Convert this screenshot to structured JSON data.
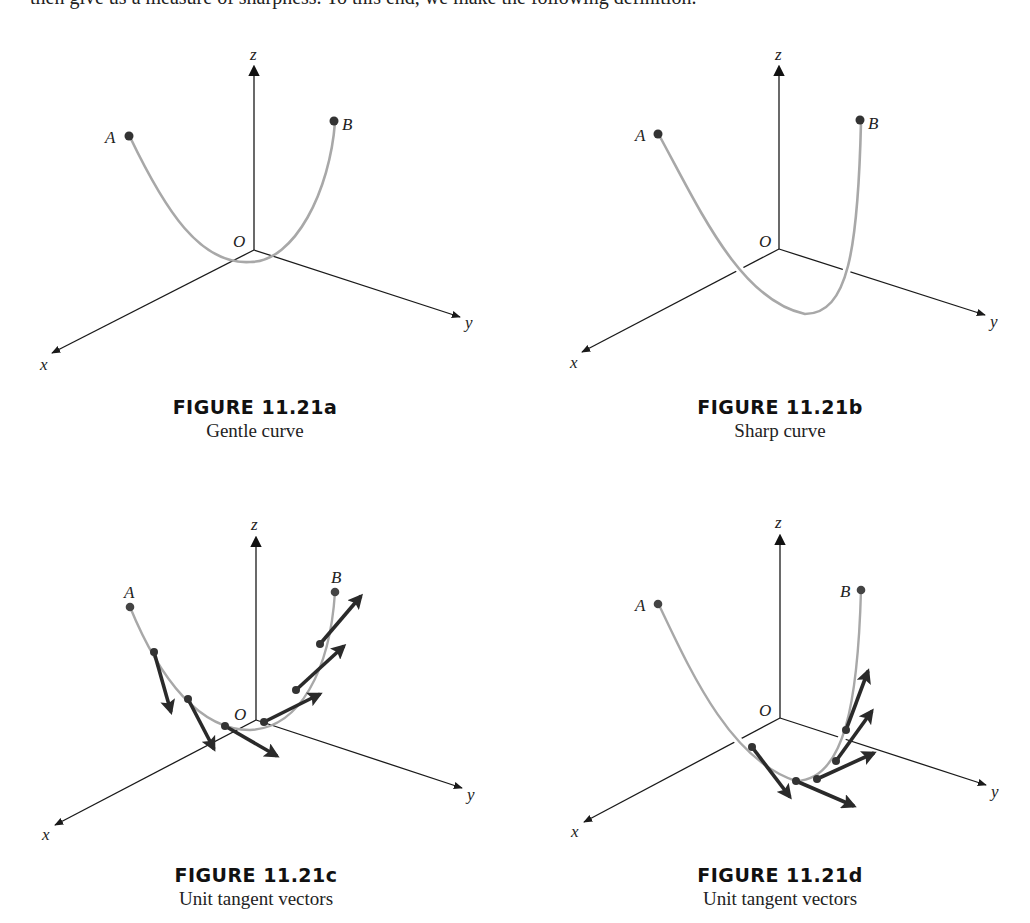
{
  "page": {
    "top_text": "then give us a measure of sharpness. To this end, we make the following definition."
  },
  "colors": {
    "axis": "#1a1a1a",
    "curve": "#a8a8a8",
    "point": "#333333",
    "vector": "#2a2a2a"
  },
  "figures": [
    {
      "id": "a",
      "title": "FIGURE 11.21a",
      "subtitle": "Gentle curve",
      "axis_labels": {
        "x": "x",
        "y": "y",
        "z": "z",
        "origin": "O"
      },
      "point_labels": {
        "start": "A",
        "end": "B"
      }
    },
    {
      "id": "b",
      "title": "FIGURE 11.21b",
      "subtitle": "Sharp curve",
      "axis_labels": {
        "x": "x",
        "y": "y",
        "z": "z",
        "origin": "O"
      },
      "point_labels": {
        "start": "A",
        "end": "B"
      }
    },
    {
      "id": "c",
      "title": "FIGURE 11.21c",
      "subtitle": "Unit tangent vectors",
      "axis_labels": {
        "x": "x",
        "y": "y",
        "z": "z",
        "origin": "O"
      },
      "point_labels": {
        "start": "A",
        "end": "B"
      }
    },
    {
      "id": "d",
      "title": "FIGURE 11.21d",
      "subtitle": "Unit tangent vectors",
      "axis_labels": {
        "x": "x",
        "y": "y",
        "z": "z",
        "origin": "O"
      },
      "point_labels": {
        "start": "A",
        "end": "B"
      }
    }
  ]
}
